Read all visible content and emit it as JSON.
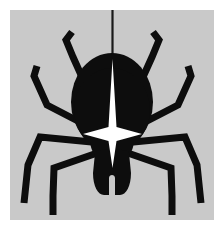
{
  "image": {
    "subject": "spider",
    "style": "silhouette-illustration",
    "alt_text": "Black widow spider silhouette hanging from a silk thread",
    "background_color": "#ffffff",
    "panel_color": "#c9c9c9",
    "ink_color": "#0d0d0d",
    "marking_color": "#ffffff"
  },
  "panel": {
    "x": 10,
    "y": 10,
    "width": 204,
    "height": 210
  },
  "parts": {
    "silk_thread": {
      "label": "silk-thread",
      "color": "#1a1a1a",
      "stroke_width": 2.2
    },
    "abdomen": {
      "label": "abdomen",
      "shape": "oval",
      "center_x": 102,
      "center_y": 92,
      "radius_x": 40,
      "radius_y": 48,
      "color": "#0d0d0d"
    },
    "hourglass_marking": {
      "label": "hourglass-marking",
      "shape": "four-point-star",
      "color": "#ffffff"
    },
    "cephalothorax": {
      "label": "cephalothorax",
      "color": "#0d0d0d"
    },
    "head": {
      "label": "head-and-fangs",
      "fang_count": 2,
      "color": "#0d0d0d"
    },
    "legs": {
      "label": "legs",
      "count": 8,
      "per_side": 4,
      "color": "#0d0d0d",
      "stroke_width": 7
    }
  },
  "caption": {
    "title": "",
    "credit": ""
  }
}
